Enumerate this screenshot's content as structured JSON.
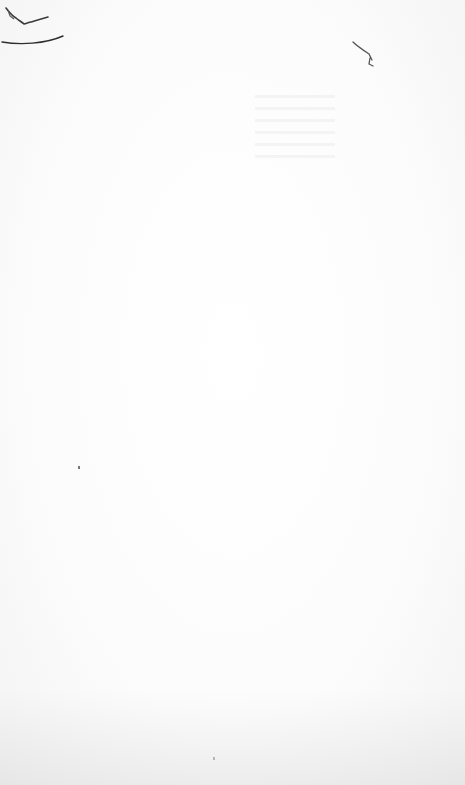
{
  "page": {
    "type": "scanned blank page",
    "background_color": "#fbfbfb",
    "marks": [
      {
        "name": "pencil-scribble-top-left",
        "color": "#3a3a3a"
      },
      {
        "name": "pencil-arc-top-left",
        "color": "#2e2e2e"
      },
      {
        "name": "pencil-mark-top-right",
        "color": "#555555"
      }
    ],
    "text": ""
  }
}
